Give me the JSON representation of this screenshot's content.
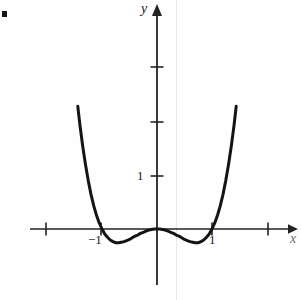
{
  "figure": {
    "background_color": "#fefefe",
    "ink_color": "#1a1a1a",
    "bullet_marker": "",
    "scan_artifact_color": "#e8e8e8"
  },
  "axes": {
    "x_axis_label": "x",
    "y_axis_label": "y",
    "x_axis_label_color": "#6a6a6a",
    "origin_px": {
      "x": 157,
      "y": 229
    },
    "unit_px": 55
  },
  "ticks": {
    "x_labeled": [
      {
        "value": -1,
        "label": "−1",
        "px": 101
      },
      {
        "value": 1,
        "label": "1",
        "px": 212
      }
    ],
    "x_unlabeled": [
      {
        "value": -2,
        "label": "",
        "px": 46
      },
      {
        "value": 2,
        "label": "",
        "px": 268
      }
    ],
    "y_labeled": [
      {
        "value": 1,
        "label": "1",
        "px": 176
      }
    ],
    "y_unlabeled": [
      {
        "value": 2,
        "label": "",
        "px": 122
      },
      {
        "value": 3,
        "label": "",
        "px": 67
      }
    ]
  },
  "chart_data": {
    "type": "line",
    "title": "",
    "subtitle": "",
    "xlabel": "x",
    "ylabel": "y",
    "grid": false,
    "legend": null,
    "xlim": [
      -2.2,
      2.4
    ],
    "ylim": [
      -0.8,
      4.2
    ],
    "xticks": [
      -2,
      -1,
      1,
      2
    ],
    "xticklabels": [
      "",
      "−1",
      "1",
      ""
    ],
    "yticks": [
      1,
      2,
      3
    ],
    "yticklabels": [
      "1",
      "",
      ""
    ],
    "annotations": [],
    "series": [
      {
        "name": "y = x⁴ − x²",
        "expression": "x^4 - x^2",
        "color": "#141414",
        "linewidth": 3,
        "roots": [
          -1,
          0,
          1
        ],
        "local_minima": [
          {
            "x": -0.7071,
            "y": -0.25
          },
          {
            "x": 0.7071,
            "y": -0.25
          }
        ],
        "local_maxima": [
          {
            "x": 0,
            "y": 0
          }
        ],
        "x": [
          -1.44,
          -1.4,
          -1.35,
          -1.3,
          -1.25,
          -1.2,
          -1.15,
          -1.1,
          -1.05,
          -1.0,
          -0.95,
          -0.9,
          -0.85,
          -0.8,
          -0.75,
          -0.7,
          -0.65,
          -0.6,
          -0.55,
          -0.5,
          -0.45,
          -0.4,
          -0.35,
          -0.3,
          -0.25,
          -0.2,
          -0.15,
          -0.1,
          -0.05,
          0.0,
          0.05,
          0.1,
          0.15,
          0.2,
          0.25,
          0.3,
          0.35,
          0.4,
          0.45,
          0.5,
          0.55,
          0.6,
          0.65,
          0.7,
          0.75,
          0.8,
          0.85,
          0.9,
          0.95,
          1.0,
          1.05,
          1.1,
          1.15,
          1.2,
          1.25,
          1.3,
          1.35,
          1.4,
          1.44
        ],
        "y": [
          2.23,
          1.88,
          1.5,
          1.17,
          0.88,
          0.63,
          0.42,
          0.25,
          0.11,
          0.0,
          -0.09,
          -0.15,
          -0.2,
          -0.23,
          -0.25,
          -0.25,
          -0.24,
          -0.23,
          -0.21,
          -0.19,
          -0.16,
          -0.13,
          -0.11,
          -0.08,
          -0.06,
          -0.04,
          -0.02,
          -0.01,
          0.0,
          0.0,
          0.0,
          -0.01,
          -0.02,
          -0.04,
          -0.06,
          -0.08,
          -0.11,
          -0.13,
          -0.16,
          -0.19,
          -0.21,
          -0.23,
          -0.24,
          -0.25,
          -0.25,
          -0.23,
          -0.2,
          -0.15,
          -0.09,
          0.0,
          0.11,
          0.25,
          0.42,
          0.63,
          0.88,
          1.17,
          1.5,
          1.88,
          2.23
        ]
      }
    ]
  }
}
